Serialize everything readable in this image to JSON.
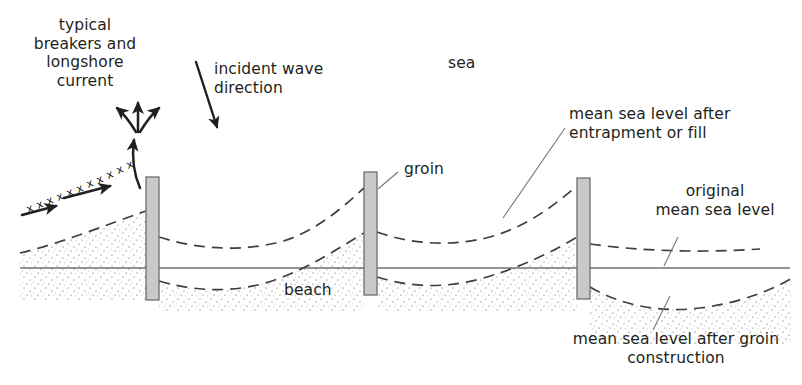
{
  "diagram": {
    "colors": {
      "ink": "#231f20",
      "line": "#58595b",
      "groin_fill": "#c9c9c9",
      "groin_stroke": "#6d6e71",
      "sand_dot": "#a9a9a9",
      "background": "#ffffff"
    },
    "labels": {
      "breakers": "typical\nbreakers and\nlongshore\ncurrent",
      "incident_wave": "incident wave\ndirection",
      "sea": "sea",
      "groin": "groin",
      "beach": "beach",
      "msl_after_entrapment": "mean sea level after\nentrapment or fill",
      "original_msl": "original\nmean sea level",
      "msl_after_groin": "mean sea level after groin\nconstruction"
    },
    "elements": {
      "groins": [
        {
          "name": "groin-1",
          "x": 146,
          "y": 177,
          "w": 13,
          "h": 123
        },
        {
          "name": "groin-2",
          "x": 364,
          "y": 172,
          "w": 13,
          "h": 123
        },
        {
          "name": "groin-3",
          "x": 577,
          "y": 178,
          "w": 13,
          "h": 121
        }
      ],
      "original_sea_level_line": {
        "x1": 20,
        "y1": 268,
        "x2": 790,
        "y2": 268
      },
      "breaker_marks": "xxxxxxxxxx",
      "arrow_count_longshore_fan": 3,
      "arrow_count_incoming": 2
    }
  }
}
